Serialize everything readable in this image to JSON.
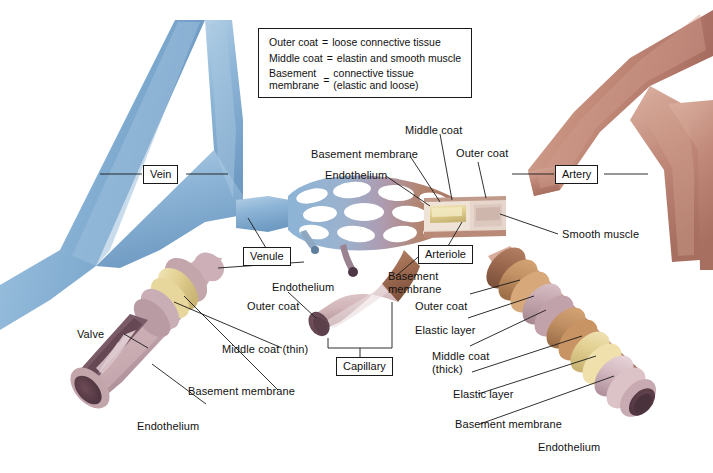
{
  "figure": {
    "background_color": "#ffffff"
  },
  "legend_box": {
    "rows": [
      {
        "term": "Outer coat",
        "eq": "=",
        "definition": "loose connective tissue"
      },
      {
        "term": "Middle coat",
        "eq": "=",
        "definition": "elastin and smooth muscle"
      },
      {
        "term": "Basement\nmembrane",
        "eq": "=",
        "definition": "connective tissue\n(elastic and loose)"
      }
    ]
  },
  "boxed_labels": {
    "vein": "Vein",
    "venule": "Venule",
    "capillary": "Capillary",
    "arteriole": "Arteriole",
    "artery": "Artery"
  },
  "labels": {
    "middle_coat_top": "Middle coat",
    "basement_membrane_top": "Basement membrane",
    "endothelium_top": "Endothelium",
    "outer_coat_top": "Outer coat",
    "smooth_muscle": "Smooth muscle",
    "endothelium_left": "Endothelium",
    "outer_coat_left": "Outer coat",
    "valve": "Valve",
    "middle_coat_thin": "Middle coat (thin)",
    "basement_membrane_left": "Basement membrane",
    "endothelium_bottom_left": "Endothelium",
    "basement_membrane_center": "Basement\nmembrane",
    "outer_coat_right": "Outer coat",
    "elastic_layer_upper": "Elastic layer",
    "middle_coat_thick": "Middle coat\n(thick)",
    "elastic_layer_lower": "Elastic layer",
    "basement_membrane_right": "Basement membrane",
    "endothelium_right": "Endothelium"
  },
  "colors": {
    "vein_blue": "#8CB4D6",
    "vein_blue_dark": "#6A95BC",
    "artery_red": "#C4897A",
    "artery_red_dark": "#A66B5C",
    "capillary_bed_left": "#8CB4D6",
    "capillary_bed_right": "#B07A62",
    "tunica_mauve": "#C6A9B0",
    "elastic_yellow": "#E8D89A",
    "lumen_dark": "#6E4C58",
    "outline": "#1a1a1a"
  }
}
